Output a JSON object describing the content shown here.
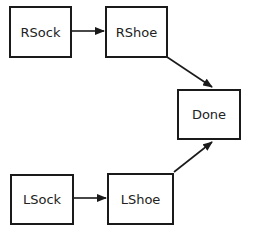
{
  "diagram": {
    "type": "flowchart",
    "nodes": [
      {
        "id": "rsock",
        "label": "RSock",
        "x": 9,
        "y": 6,
        "w": 63,
        "h": 52
      },
      {
        "id": "rshoe",
        "label": "RShoe",
        "x": 105,
        "y": 6,
        "w": 63,
        "h": 52
      },
      {
        "id": "done",
        "label": "Done",
        "x": 177,
        "y": 89,
        "w": 64,
        "h": 51
      },
      {
        "id": "lsock",
        "label": "LSock",
        "x": 10,
        "y": 174,
        "w": 64,
        "h": 51
      },
      {
        "id": "lshoe",
        "label": "LShoe",
        "x": 107,
        "y": 173,
        "w": 67,
        "h": 52
      }
    ],
    "edges": [
      {
        "from": "rsock",
        "to": "rshoe"
      },
      {
        "from": "rshoe",
        "to": "done"
      },
      {
        "from": "lsock",
        "to": "lshoe"
      },
      {
        "from": "lshoe",
        "to": "done"
      }
    ],
    "colors": {
      "stroke": "#1a1a1a",
      "text": "#222222",
      "background": "#ffffff"
    }
  }
}
